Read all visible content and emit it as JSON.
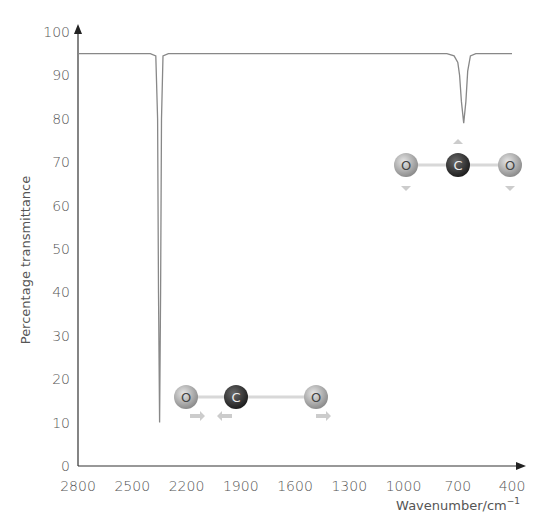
{
  "chart_data": {
    "type": "line",
    "title": "",
    "xlabel": "Wavenumber/cm",
    "xlabel_superscript": "−1",
    "ylabel": "Percentage transmittance",
    "xlim": [
      2800,
      400
    ],
    "ylim": [
      0,
      100
    ],
    "x_ticks": [
      2800,
      2500,
      2200,
      1900,
      1600,
      1300,
      1000,
      700,
      400
    ],
    "y_ticks": [
      0,
      10,
      20,
      30,
      40,
      50,
      60,
      70,
      80,
      90,
      100
    ],
    "grid": false,
    "legend": null,
    "baseline": 95,
    "series": [
      {
        "name": "CO2 IR spectrum",
        "color": "#888888",
        "peaks": [
          {
            "wavenumber": 2349,
            "transmittance": 10,
            "label": "asymmetric stretch"
          },
          {
            "wavenumber": 667,
            "transmittance": 79,
            "label": "bending"
          }
        ],
        "x": [
          2800,
          2400,
          2370,
          2360,
          2355,
          2349,
          2343,
          2338,
          2330,
          2300,
          1000,
          760,
          720,
          700,
          690,
          680,
          667,
          655,
          645,
          630,
          600,
          400
        ],
        "values": [
          95,
          95,
          94.5,
          80,
          40,
          10,
          40,
          80,
          94.5,
          95,
          95,
          95,
          94.5,
          93,
          90,
          84,
          79,
          84,
          91,
          94.5,
          95,
          95
        ]
      }
    ],
    "annotations": [
      {
        "type": "molecule",
        "atoms": [
          "O",
          "C",
          "O"
        ],
        "mode": "asymmetric stretch",
        "position": "near 2349 peak, ~y 13%"
      },
      {
        "type": "molecule",
        "atoms": [
          "O",
          "C",
          "O"
        ],
        "mode": "bending",
        "position": "below 667 peak, ~y 70%"
      }
    ]
  },
  "molecules": {
    "stretch": {
      "atom1": "O",
      "atom2": "C",
      "atom3": "O"
    },
    "bend": {
      "atom1": "O",
      "atom2": "C",
      "atom3": "O"
    }
  },
  "colors": {
    "axis": "#333333",
    "line": "#888888",
    "oxygen": "#a8a8a8",
    "carbon": "#333333"
  }
}
